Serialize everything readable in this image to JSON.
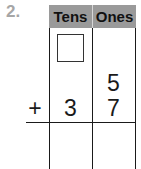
{
  "problem": {
    "number": "2."
  },
  "place_value_chart": {
    "headers": {
      "tens": "Tens",
      "ones": "Ones"
    },
    "regroup_box": {
      "value": ""
    },
    "rows": [
      {
        "operator": "",
        "tens": "",
        "ones": "5"
      },
      {
        "operator": "+",
        "tens": "3",
        "ones": "7"
      }
    ],
    "answer": {
      "tens": "",
      "ones": ""
    }
  },
  "colors": {
    "header_background": "#9a9a9a",
    "problem_number": "#a6a6a6",
    "lines": "#1a1a1a"
  }
}
